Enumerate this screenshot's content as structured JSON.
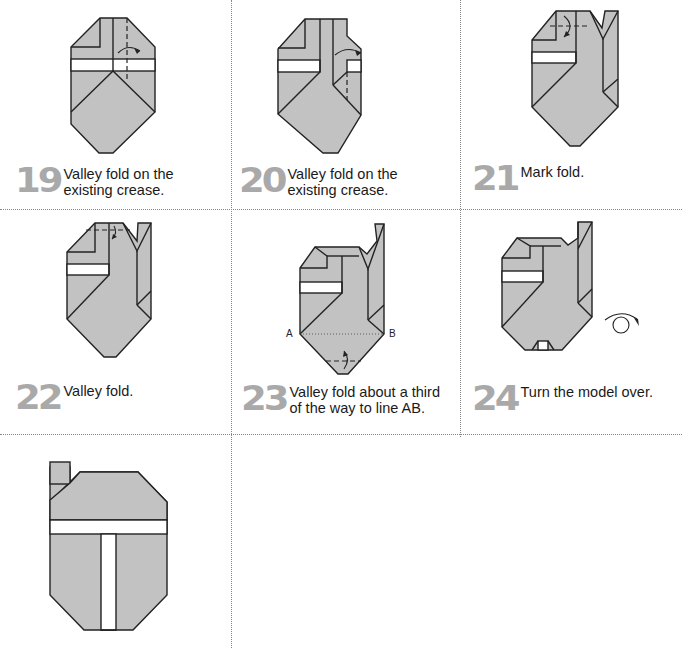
{
  "steps": [
    {
      "number": "19",
      "text_line1": "Valley fold on the",
      "text_line2": "existing crease."
    },
    {
      "number": "20",
      "text_line1": "Valley fold on the",
      "text_line2": "existing crease."
    },
    {
      "number": "21",
      "text_line1": "Mark fold.",
      "text_line2": ""
    },
    {
      "number": "22",
      "text_line1": "Valley fold.",
      "text_line2": ""
    },
    {
      "number": "23",
      "text_line1": "Valley fold about a third",
      "text_line2": "of the way to line AB."
    },
    {
      "number": "24",
      "text_line1": "Turn the model over.",
      "text_line2": ""
    }
  ],
  "labels": {
    "point_a": "A",
    "point_b": "B"
  },
  "colors": {
    "paper": "#c2c2c2",
    "step_number": "#a9a9a9",
    "separator": "#888888"
  }
}
